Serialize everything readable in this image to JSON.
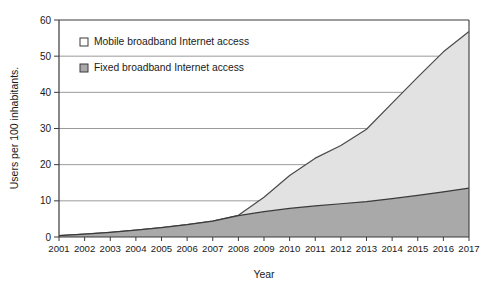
{
  "chart_data": {
    "type": "area",
    "title": "",
    "xlabel": "Year",
    "ylabel": "Users per 100 inhabitants.",
    "xlim": [
      2001,
      2017
    ],
    "ylim": [
      0,
      60
    ],
    "grid": true,
    "stacked": false,
    "legend_position": "top-left-inside",
    "y_ticks": [
      0,
      10,
      20,
      30,
      40,
      50,
      60
    ],
    "y_tick_labels": [
      "0",
      "10",
      "20",
      "30",
      "40",
      "50",
      "60"
    ],
    "categories": [
      2001,
      2002,
      2003,
      2004,
      2005,
      2006,
      2007,
      2008,
      2009,
      2010,
      2011,
      2012,
      2013,
      2014,
      2015,
      2016,
      2017
    ],
    "x_tick_labels": [
      "2001",
      "2002",
      "2003",
      "2004",
      "2005",
      "2006",
      "2007",
      "2008",
      "2009",
      "2010",
      "2011",
      "2012",
      "2013",
      "2014",
      "2015",
      "2016",
      "2017"
    ],
    "series": [
      {
        "name": "Mobile broadband Internet access",
        "color": "#e2e2e2",
        "line_color": "#4a4a4a",
        "marker": "open-square",
        "values": [
          0.4,
          0.8,
          1.3,
          1.9,
          2.6,
          3.4,
          4.4,
          6.0,
          11.0,
          17.0,
          21.8,
          25.3,
          29.8,
          37.0,
          44.2,
          51.2,
          56.8
        ]
      },
      {
        "name": "Fixed broadband Internet access",
        "color": "#a9a9a9",
        "line_color": "#3a3a3a",
        "marker": "filled-square",
        "values": [
          0.4,
          0.8,
          1.3,
          1.9,
          2.6,
          3.4,
          4.4,
          5.9,
          7.0,
          7.9,
          8.6,
          9.2,
          9.8,
          10.6,
          11.5,
          12.5,
          13.5
        ]
      }
    ],
    "legend": [
      {
        "label": "Mobile broadband Internet access",
        "marker": "open-square",
        "fill": "#ffffff"
      },
      {
        "label": "Fixed broadband Internet access",
        "marker": "filled-square",
        "fill": "#a9a9a9"
      }
    ]
  }
}
